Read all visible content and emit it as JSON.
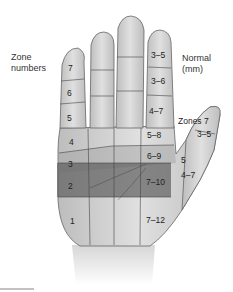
{
  "labels": {
    "zone_title": "Zone",
    "zone_title_2": "numbers",
    "normal_title": "Normal",
    "normal_unit": "(mm)",
    "thumb_title": "Zones 7"
  },
  "zones": [
    {
      "zone": "7",
      "normal": "3–5"
    },
    {
      "zone": "6",
      "normal": "3–6"
    },
    {
      "zone": "5",
      "normal": "4–7"
    },
    {
      "zone": "4",
      "normal": "5–8"
    },
    {
      "zone": "3",
      "normal": "6–9"
    },
    {
      "zone": "2",
      "normal": "7–10"
    },
    {
      "zone": "1",
      "normal": "7–12"
    }
  ],
  "thumb_zones": [
    {
      "zone": "7",
      "normal": "3–5"
    },
    {
      "zone": "5",
      "normal": "4–7"
    }
  ],
  "colors": {
    "skin": "#c9c9c9",
    "skin_light": "#e2e2e2",
    "outline": "#555555",
    "zone2_shade": "#6f6f6f",
    "zone3_shade": "#a8a8a8"
  }
}
